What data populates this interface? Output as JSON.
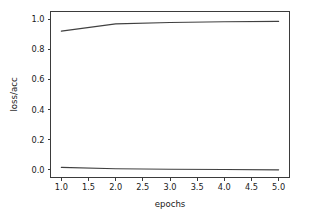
{
  "chart_data": {
    "type": "line",
    "title": "",
    "xlabel": "epochs",
    "ylabel": "loss/acc",
    "xlim": [
      0.8,
      5.2
    ],
    "ylim": [
      -0.05,
      1.05
    ],
    "grid": false,
    "legend": "none",
    "x": [
      1.0,
      2.0,
      3.0,
      4.0,
      5.0
    ],
    "xticks": [
      "1.0",
      "1.5",
      "2.0",
      "2.5",
      "3.0",
      "3.5",
      "4.0",
      "4.5",
      "5.0"
    ],
    "xtick_values": [
      1.0,
      1.5,
      2.0,
      2.5,
      3.0,
      3.5,
      4.0,
      4.5,
      5.0
    ],
    "yticks": [
      "0.0",
      "0.2",
      "0.4",
      "0.6",
      "0.8",
      "1.0"
    ],
    "ytick_values": [
      0.0,
      0.2,
      0.4,
      0.6,
      0.8,
      1.0
    ],
    "series": [
      {
        "name": "acc",
        "color": "#404040",
        "values": [
          0.92,
          0.968,
          0.977,
          0.982,
          0.985
        ]
      },
      {
        "name": "loss",
        "color": "#404040",
        "values": [
          0.017,
          0.008,
          0.005,
          0.003,
          0.001
        ]
      }
    ]
  },
  "figure": {
    "background": "#ffffff",
    "axes_color": "#3b3b3b",
    "text_color": "#1a1a1a"
  }
}
